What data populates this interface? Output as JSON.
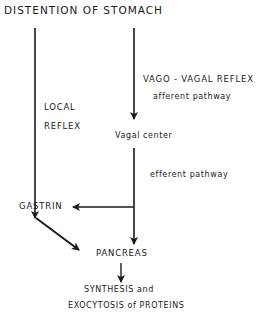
{
  "diagram": {
    "title": "DISTENTION OF STOMACH",
    "nodes": {
      "stimulus": "DISTENTION OF STOMACH",
      "vagal_center": "Vagal center",
      "gastrin": "GASTRIN",
      "pancreas": "PANCREAS",
      "output_line1": "SYNTHESIS and",
      "output_line2": "EXOCYTOSIS of PROTEINS"
    },
    "labels": {
      "local_line1": "LOCAL",
      "local_line2": "REFLEX",
      "vago_vagal": "VAGO - VAGAL REFLEX",
      "afferent": "afferent pathway",
      "efferent": "efferent pathway"
    },
    "edges": [
      {
        "from": "stimulus",
        "to": "gastrin",
        "label": "LOCAL REFLEX"
      },
      {
        "from": "stimulus",
        "to": "vagal_center",
        "label": "VAGO-VAGAL REFLEX afferent pathway"
      },
      {
        "from": "vagal_center",
        "to": "pancreas",
        "label": "efferent pathway"
      },
      {
        "from": "vagal_center",
        "to": "gastrin",
        "label": ""
      },
      {
        "from": "gastrin",
        "to": "pancreas",
        "label": ""
      },
      {
        "from": "pancreas",
        "to": "output",
        "label": ""
      }
    ],
    "line_color": "#1a1a1a"
  }
}
